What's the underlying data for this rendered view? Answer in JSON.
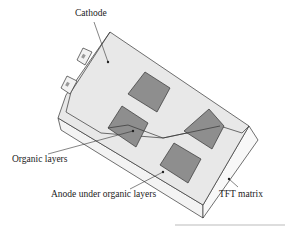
{
  "diagram": {
    "type": "OLED panel schematic",
    "labels": {
      "cathode": "Cathode",
      "organic_layers": "Organic layers",
      "anode": "Anode under organic layers",
      "tft": "TFT matrix"
    },
    "colors": {
      "top_face": "#e6e6e6",
      "side_face": "#f4f4f4",
      "pixel": "#8c8c8c",
      "outline": "#333333"
    },
    "pixel_count": 4,
    "contact_tab_count": 2
  }
}
